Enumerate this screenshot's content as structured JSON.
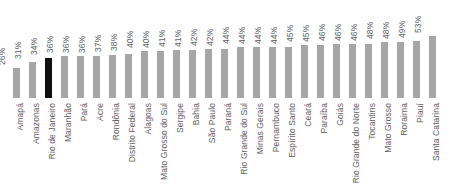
{
  "chart_data": {
    "type": "bar",
    "title": "",
    "subtitle": "",
    "xlabel": "",
    "ylabel": "",
    "ylim": [
      0,
      60
    ],
    "grid": false,
    "legend": null,
    "orientation": "vertical",
    "value_label_suffix": "%",
    "sorted": "ascending",
    "colors": {
      "bar": "#a6a6a6",
      "highlight": "#101010",
      "text": "#5e5e5e",
      "background": "#ffffff"
    },
    "highlight_category": "Rio de Janeiro",
    "categories": [
      "Amapá",
      "Amazonas",
      "Rio de Janeiro",
      "Maranhão",
      "Pará",
      "Acre",
      "Rondônia",
      "Distrito Federal",
      "Alagoas",
      "Mato Grosso do Sul",
      "Sergipe",
      "Bahia",
      "São Paulo",
      "Paraná",
      "Rio Grande do Sul",
      "Minas Gerais",
      "Pernambuco",
      "Espírito Santo",
      "Ceará",
      "Paraíba",
      "Goiás",
      "Rio Grande do Norte",
      "Tocantins",
      "Mato Grosso",
      "Roraima",
      "Piauí",
      "Santa Catarina"
    ],
    "values": [
      26,
      31,
      34,
      36,
      36,
      36,
      37,
      38,
      40,
      40,
      41,
      41,
      42,
      42,
      44,
      44,
      44,
      44,
      45,
      45,
      46,
      46,
      46,
      48,
      48,
      49,
      53
    ],
    "value_labels": [
      "26%",
      "31%",
      "34%",
      "36%",
      "36%",
      "36%",
      "37%",
      "38%",
      "40%",
      "40%",
      "41%",
      "41%",
      "42%",
      "42%",
      "44%",
      "44%",
      "44%",
      "44%",
      "45%",
      "45%",
      "46%",
      "46%",
      "46%",
      "48%",
      "48%",
      "49%",
      "53%"
    ]
  }
}
